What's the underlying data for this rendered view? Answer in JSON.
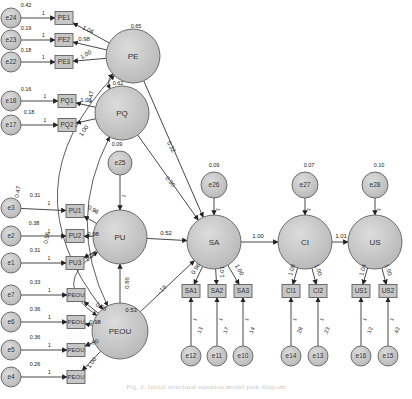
{
  "diagram": {
    "type": "structural-equation-model",
    "colors": {
      "node_fill": "#c8c8c8",
      "node_stroke": "#606060",
      "edge": "#333333",
      "label": "#222222"
    },
    "latent": [
      {
        "id": "PE",
        "label": "PE",
        "x": 133,
        "y": 56,
        "r": 27,
        "variance": "0.65",
        "vx": 136,
        "vy": 27
      },
      {
        "id": "PQ",
        "label": "PQ",
        "x": 122,
        "y": 113,
        "r": 27,
        "variance": "0.62",
        "vx": 118,
        "vy": 84
      },
      {
        "id": "PU",
        "label": "PU",
        "x": 120,
        "y": 237,
        "r": 27,
        "variance": "",
        "vx": 0,
        "vy": 0
      },
      {
        "id": "PEOU",
        "label": "PEOU",
        "x": 120,
        "y": 331,
        "r": 28,
        "variance": "",
        "vx": 0,
        "vy": 0
      },
      {
        "id": "SA",
        "label": "SA",
        "x": 214,
        "y": 242,
        "r": 27,
        "variance": "",
        "vx": 0,
        "vy": 0
      },
      {
        "id": "CI",
        "label": "CI",
        "x": 305,
        "y": 242,
        "r": 27,
        "variance": "",
        "vx": 0,
        "vy": 0
      },
      {
        "id": "US",
        "label": "US",
        "x": 375,
        "y": 242,
        "r": 27,
        "variance": "",
        "vx": 0,
        "vy": 0
      }
    ],
    "disturbances": [
      {
        "id": "e25",
        "label": "e25",
        "x": 120,
        "y": 163,
        "r": 12,
        "variance": "0.09",
        "vx": 117,
        "vy": 145,
        "target": "PU"
      },
      {
        "id": "e26",
        "label": "e26",
        "x": 214,
        "y": 185,
        "r": 13,
        "variance": "0.09",
        "vx": 214,
        "vy": 166,
        "target": "SA"
      },
      {
        "id": "e27",
        "label": "e27",
        "x": 305,
        "y": 185,
        "r": 13,
        "variance": "0.07",
        "vx": 309,
        "vy": 166,
        "target": "CI"
      },
      {
        "id": "e28",
        "label": "e28",
        "x": 375,
        "y": 185,
        "r": 13,
        "variance": "0.10",
        "vx": 379,
        "vy": 166,
        "target": "US"
      }
    ],
    "indicators": [
      {
        "id": "PE1",
        "label": "PE1",
        "x": 64,
        "y": 18,
        "latent": "PE",
        "loading": "1.04",
        "lx": 88,
        "ly": 30,
        "lrot": 25
      },
      {
        "id": "PE2",
        "label": "PE2",
        "x": 64,
        "y": 40,
        "latent": "PE",
        "loading": "0.98",
        "lx": 84,
        "ly": 39,
        "lrot": 0
      },
      {
        "id": "PE3",
        "label": "PE3",
        "x": 64,
        "y": 62,
        "latent": "PE",
        "loading": "1.00",
        "lx": 86,
        "ly": 55,
        "lrot": -30
      },
      {
        "id": "PQ1",
        "label": "PQ1",
        "x": 67,
        "y": 101,
        "latent": "PQ",
        "loading": "1.01",
        "lx": 86,
        "ly": 100,
        "lrot": 0
      },
      {
        "id": "PQ2",
        "label": "PQ2",
        "x": 67,
        "y": 125,
        "latent": "PQ",
        "loading": "1.00",
        "lx": 84,
        "ly": 131,
        "lrot": -55
      },
      {
        "id": "PU1",
        "label": "PU1",
        "x": 75,
        "y": 211,
        "latent": "PU",
        "loading": "0.96",
        "lx": 93,
        "ly": 210,
        "lrot": 30
      },
      {
        "id": "PU2",
        "label": "PU2",
        "x": 75,
        "y": 236,
        "latent": "PU",
        "loading": "0.98",
        "lx": 93,
        "ly": 234,
        "lrot": 0
      },
      {
        "id": "PU3",
        "label": "PU3",
        "x": 75,
        "y": 263,
        "latent": "PU",
        "loading": "1.00",
        "lx": 91,
        "ly": 257,
        "lrot": -35
      },
      {
        "id": "PEOU1",
        "label": "PEOU",
        "x": 76,
        "y": 295,
        "latent": "PEOU",
        "loading": "0.95",
        "lx": 101,
        "ly": 307,
        "lrot": 30
      },
      {
        "id": "PEOU2",
        "label": "PEOU",
        "x": 76,
        "y": 322,
        "latent": "PEOU",
        "loading": "0.98",
        "lx": 95,
        "ly": 322,
        "lrot": 0
      },
      {
        "id": "PEOU3",
        "label": "PEOU",
        "x": 76,
        "y": 350,
        "latent": "PEOU",
        "loading": "0.90",
        "lx": 93,
        "ly": 343,
        "lrot": -20
      },
      {
        "id": "PEOU4",
        "label": "PEOU",
        "x": 76,
        "y": 377,
        "latent": "PEOU",
        "loading": "1.00",
        "lx": 92,
        "ly": 363,
        "lrot": -55
      },
      {
        "id": "SA1",
        "label": "SA1",
        "x": 191,
        "y": 291,
        "latent": "SA",
        "loading": "0.96",
        "lx": 196,
        "ly": 269,
        "lrot": -55
      },
      {
        "id": "SA2",
        "label": "SA2",
        "x": 217,
        "y": 291,
        "latent": "SA",
        "loading": "1.01",
        "lx": 222,
        "ly": 272,
        "lrot": -90
      },
      {
        "id": "SA3",
        "label": "SA3",
        "x": 243,
        "y": 291,
        "latent": "SA",
        "loading": "1.00",
        "lx": 239,
        "ly": 270,
        "lrot": 60
      },
      {
        "id": "CI1",
        "label": "CI1",
        "x": 291,
        "y": 291,
        "latent": "CI",
        "loading": "1.08",
        "lx": 292,
        "ly": 270,
        "lrot": -75
      },
      {
        "id": "CI2",
        "label": "CI2",
        "x": 318,
        "y": 291,
        "latent": "CI",
        "loading": "1.00",
        "lx": 318,
        "ly": 270,
        "lrot": 70
      },
      {
        "id": "US1",
        "label": "US1",
        "x": 361,
        "y": 291,
        "latent": "US",
        "loading": "1.04",
        "lx": 363,
        "ly": 270,
        "lrot": -75
      },
      {
        "id": "US2",
        "label": "US2",
        "x": 388,
        "y": 291,
        "latent": "US",
        "loading": "1.00",
        "lx": 388,
        "ly": 270,
        "lrot": 70
      }
    ],
    "errors_left": [
      {
        "id": "e24",
        "label": "e24",
        "x": 11,
        "y": 18,
        "variance": "0.42",
        "vx": 26,
        "vy": 6,
        "target": "PE1"
      },
      {
        "id": "e23",
        "label": "e23",
        "x": 11,
        "y": 40,
        "variance": "0.19",
        "vx": 26,
        "vy": 29,
        "target": "PE2"
      },
      {
        "id": "e22",
        "label": "e22",
        "x": 11,
        "y": 62,
        "variance": "0.18",
        "vx": 26,
        "vy": 51,
        "target": "PE3"
      },
      {
        "id": "e18",
        "label": "e18",
        "x": 11,
        "y": 101,
        "variance": "0.16",
        "vx": 26,
        "vy": 90,
        "target": "PQ1"
      },
      {
        "id": "e17",
        "label": "e17",
        "x": 11,
        "y": 125,
        "variance": "0.18",
        "vx": 29,
        "vy": 113,
        "target": "PQ2"
      },
      {
        "id": "e3",
        "label": "e3",
        "x": 11,
        "y": 208,
        "variance": "0.31",
        "vx": 35,
        "vy": 196,
        "target": "PU1"
      },
      {
        "id": "e2",
        "label": "e2",
        "x": 11,
        "y": 236,
        "variance": "0.38",
        "vx": 34,
        "vy": 224,
        "target": "PU2"
      },
      {
        "id": "e1",
        "label": "e1",
        "x": 11,
        "y": 263,
        "variance": "0.31",
        "vx": 35,
        "vy": 251,
        "target": "PU3"
      },
      {
        "id": "e7",
        "label": "e7",
        "x": 11,
        "y": 295,
        "variance": "0.33",
        "vx": 35,
        "vy": 283,
        "target": "PEOU1"
      },
      {
        "id": "e6",
        "label": "e6",
        "x": 11,
        "y": 322,
        "variance": "0.36",
        "vx": 35,
        "vy": 310,
        "target": "PEOU2"
      },
      {
        "id": "e5",
        "label": "e5",
        "x": 11,
        "y": 350,
        "variance": "0.36",
        "vx": 35,
        "vy": 338,
        "target": "PEOU3"
      },
      {
        "id": "e4",
        "label": "e4",
        "x": 11,
        "y": 377,
        "variance": "0.26",
        "vx": 35,
        "vy": 365,
        "target": "PEOU4"
      }
    ],
    "errors_bottom": [
      {
        "id": "e12",
        "label": "e12",
        "x": 191,
        "y": 356,
        "variance": ".13",
        "vx": 200,
        "vy": 331,
        "target": "SA1"
      },
      {
        "id": "e11",
        "label": "e11",
        "x": 217,
        "y": 356,
        "variance": ".17",
        "vx": 226,
        "vy": 331,
        "target": "SA2"
      },
      {
        "id": "e10",
        "label": "e10",
        "x": 243,
        "y": 356,
        "variance": ".14",
        "vx": 252,
        "vy": 331,
        "target": "SA3"
      },
      {
        "id": "e14",
        "label": "e14",
        "x": 291,
        "y": 356,
        "variance": ".28",
        "vx": 300,
        "vy": 331,
        "target": "CI1"
      },
      {
        "id": "e13",
        "label": "e13",
        "x": 318,
        "y": 356,
        "variance": ".23",
        "vx": 327,
        "vy": 331,
        "target": "CI2"
      },
      {
        "id": "e16",
        "label": "e16",
        "x": 361,
        "y": 356,
        "variance": ".12",
        "vx": 370,
        "vy": 331,
        "target": "US1"
      },
      {
        "id": "e15",
        "label": "e15",
        "x": 388,
        "y": 356,
        "variance": ".42",
        "vx": 397,
        "vy": 331,
        "target": "US2"
      }
    ],
    "structural_paths": [
      {
        "from": "PE",
        "to": "SA",
        "coef": "0.32",
        "lx": 171,
        "ly": 147,
        "lrot": 62
      },
      {
        "from": "PQ",
        "to": "SA",
        "coef": "0.30",
        "lx": 170,
        "ly": 182,
        "lrot": 50
      },
      {
        "from": "PU",
        "to": "SA",
        "coef": "0.52",
        "lx": 166,
        "ly": 233,
        "lrot": 0
      },
      {
        "from": "PEOU",
        "to": "SA",
        "coef": "-.18",
        "lx": 162,
        "ly": 290,
        "lrot": -45
      },
      {
        "from": "PEOU",
        "to": "PU",
        "coef": "0.86",
        "lx": 127,
        "ly": 283,
        "lrot": -90
      },
      {
        "from": "SA",
        "to": "CI",
        "coef": "1.00",
        "lx": 258,
        "ly": 236,
        "lrot": 0
      },
      {
        "from": "CI",
        "to": "US",
        "coef": "1.01",
        "lx": 341,
        "ly": 236,
        "lrot": 0
      }
    ],
    "covariances": [
      {
        "from": "PE",
        "to": "PQ",
        "coef": "0.47",
        "lx": 91,
        "ly": 97,
        "lrot": -80
      },
      {
        "from": "PE",
        "to": "PEOU",
        "coef": "0.47",
        "lx": 18,
        "ly": 192,
        "lrot": -80
      },
      {
        "from": "PQ",
        "to": "PEOU",
        "coef": "0.53",
        "lx": 131,
        "ly": 310,
        "lrot": 0
      },
      {
        "from": "PU",
        "to": "PEOU",
        "coef": "0.56",
        "lx": 47,
        "ly": 238,
        "lrot": -80
      }
    ],
    "fixed_label": "1",
    "caption": "Fig. 2. Initial structural equation model path diagram"
  }
}
